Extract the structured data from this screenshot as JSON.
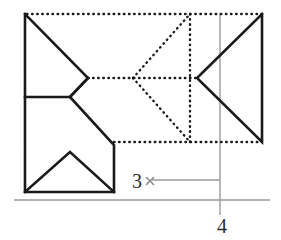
{
  "figure": {
    "canvas": {
      "width": 281,
      "height": 240,
      "background": "#ffffff"
    },
    "colors": {
      "solid_stroke": "#1a1a1a",
      "dotted_stroke": "#1a1a1a",
      "axis_gray": "#9a9a9a",
      "label_text": "#2b2b2b",
      "cross_mark": "#8c8c8c"
    },
    "stroke_widths": {
      "solid": 2.6,
      "dotted": 2.4,
      "axis": 1.4
    },
    "labels": [
      {
        "name": "label-3",
        "text": "3",
        "x": 137,
        "y": 188,
        "anchor": "middle"
      },
      {
        "name": "label-4",
        "text": "4",
        "x": 222,
        "y": 233,
        "anchor": "middle"
      }
    ],
    "solid_shapes": [
      {
        "name": "left-upper-arrow-polyline",
        "points": "25,14 25,97 70,97 88,78 25,14"
      },
      {
        "name": "left-lower-polyline",
        "points": "70,97 114,145 114,192 25,192 25,97"
      },
      {
        "name": "lower-inner-peak-polyline",
        "points": "25,192 70,152 114,192"
      },
      {
        "name": "middle-notch-lower-edge",
        "points": "88,78 70,97"
      },
      {
        "name": "right-triangle",
        "points": "262,14 197,78 262,142 262,14"
      }
    ],
    "dotted_lines": [
      {
        "name": "top-dotted-boundary",
        "x1": 27,
        "y1": 14,
        "x2": 262,
        "y2": 14
      },
      {
        "name": "bottom-dotted-boundary",
        "x1": 114,
        "y1": 142,
        "x2": 262,
        "y2": 142
      },
      {
        "name": "center-horizontal-dotted",
        "x1": 88,
        "y1": 78,
        "x2": 197,
        "y2": 78
      },
      {
        "name": "inner-vertical-dotted",
        "x1": 190,
        "y1": 14,
        "x2": 190,
        "y2": 142
      },
      {
        "name": "dotted-triangle-upper-edge",
        "x1": 133,
        "y1": 78,
        "x2": 190,
        "y2": 14
      },
      {
        "name": "dotted-triangle-lower-edge",
        "x1": 133,
        "y1": 78,
        "x2": 190,
        "y2": 142
      }
    ],
    "axes": [
      {
        "name": "vertical-axis-4",
        "x1": 220,
        "y1": 14,
        "x2": 220,
        "y2": 215
      },
      {
        "name": "horizontal-baseline-axis",
        "x1": 14,
        "y1": 200,
        "x2": 270,
        "y2": 200
      },
      {
        "name": "horizontal-tick-line-3",
        "x1": 152,
        "y1": 180,
        "x2": 220,
        "y2": 180
      }
    ],
    "cross_marks": [
      {
        "name": "cross-mark-3",
        "cx": 150,
        "cy": 181,
        "size": 7
      }
    ]
  }
}
